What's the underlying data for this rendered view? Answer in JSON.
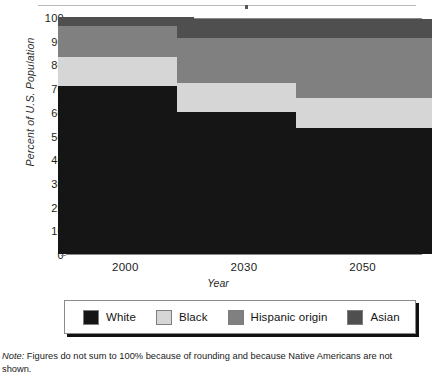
{
  "chart_data": {
    "type": "bar",
    "subtype": "stacked-column",
    "title": "",
    "xlabel": "Year",
    "ylabel": "Percent of U.S. Population",
    "categories": [
      "2000",
      "2030",
      "2050"
    ],
    "ylim": [
      0,
      100
    ],
    "yticks": [
      0,
      10,
      20,
      30,
      40,
      50,
      60,
      70,
      80,
      90,
      100
    ],
    "ytick_labels": [
      "0",
      "10",
      "20",
      "30",
      "40",
      "50",
      "60",
      "70",
      "80",
      "90",
      "100"
    ],
    "grid": true,
    "grid_style": "dashed-horizontal",
    "legend_position": "bottom",
    "series": [
      {
        "name": "White",
        "color": "#151515",
        "values": [
          71,
          60,
          53
        ]
      },
      {
        "name": "Black",
        "color": "#d6d6d6",
        "values": [
          12,
          12,
          13
        ]
      },
      {
        "name": "Hispanic origin",
        "color": "#808080",
        "values": [
          13,
          19,
          25
        ]
      },
      {
        "name": "Asian",
        "color": "#4f4f4f",
        "values": [
          4,
          8,
          8
        ]
      }
    ],
    "note": "Figures do not sum to 100% because of rounding and because Native Americans are not shown."
  },
  "footnote": {
    "lead": "Note:",
    "text": " Figures do not sum to 100% because of rounding and because Native Americans are not shown."
  }
}
